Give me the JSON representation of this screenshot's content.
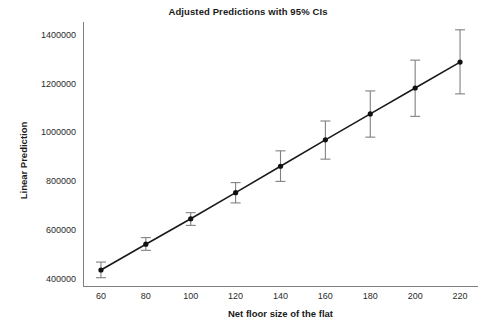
{
  "chart_data": {
    "type": "line",
    "title": "Adjusted Predictions with 95% CIs",
    "xlabel": "Net floor size of the flat",
    "ylabel": "Linear Prediction",
    "x": [
      60,
      80,
      100,
      120,
      140,
      160,
      180,
      200,
      220
    ],
    "values": [
      437500,
      543000,
      647000,
      754000,
      862000,
      970000,
      1076000,
      1182000,
      1288000
    ],
    "ci_lower": [
      406000,
      518000,
      620000,
      712000,
      800000,
      891000,
      981000,
      1066000,
      1158000
    ],
    "ci_upper": [
      470000,
      570000,
      672000,
      795000,
      925000,
      1047000,
      1170000,
      1296000,
      1420000
    ],
    "xticks": [
      60,
      80,
      100,
      120,
      140,
      160,
      180,
      200,
      220
    ],
    "xtick_labels": [
      "60",
      "80",
      "100",
      "120",
      "140",
      "160",
      "180",
      "200",
      "220"
    ],
    "yticks": [
      400000,
      600000,
      800000,
      1000000,
      1200000,
      1400000
    ],
    "ytick_labels": [
      "400000",
      "600000",
      "800000",
      "1000000",
      "1200000",
      "1400000"
    ],
    "xlim": [
      52,
      228
    ],
    "ylim": [
      368000,
      1452000
    ],
    "grid": false,
    "legend": null,
    "series_name": "Linear Prediction",
    "colors": {
      "line": "#1a1a1a",
      "marker": "#111111",
      "error_bar": "#808080",
      "axis": "#808080",
      "text": "#1a1a1a",
      "background": "#ffffff"
    }
  }
}
